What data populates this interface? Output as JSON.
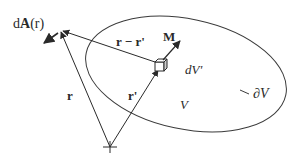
{
  "diagram": {
    "type": "vector-field-geometry",
    "colors": {
      "stroke": "#2a2a2a",
      "background": "#ffffff"
    },
    "labels": {
      "dA": "dA(r)",
      "dA_prefix": "d",
      "dA_bold": "A",
      "dA_arg": "(r)",
      "r_minus_rprime": "r − r'",
      "M": "M",
      "dV": "dV'",
      "r": "r",
      "rprime": "r'",
      "V": "V",
      "boundary": "∂V"
    },
    "elements": [
      {
        "id": "origin",
        "kind": "cross-marker"
      },
      {
        "id": "observation-point",
        "kind": "point"
      },
      {
        "id": "volume-element",
        "kind": "cube"
      },
      {
        "id": "region",
        "kind": "ellipse",
        "label": "V",
        "boundary_label": "∂V"
      },
      {
        "id": "vector-r",
        "from": "origin",
        "to": "observation-point",
        "label": "r"
      },
      {
        "id": "vector-rprime",
        "from": "origin",
        "to": "volume-element",
        "label": "r'"
      },
      {
        "id": "vector-r-minus-rprime",
        "from": "volume-element",
        "to": "observation-point",
        "label": "r − r'"
      },
      {
        "id": "vector-M",
        "from": "volume-element",
        "label": "M"
      },
      {
        "id": "vector-dA",
        "from": "observation-point",
        "label": "dA(r)"
      }
    ]
  }
}
